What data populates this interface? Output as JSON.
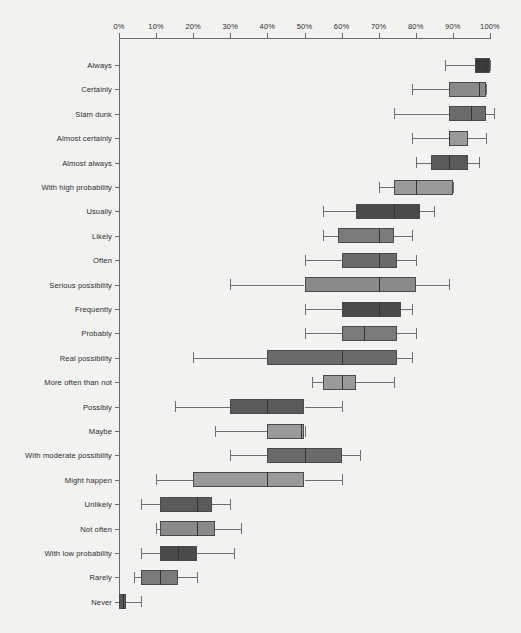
{
  "chart_data": {
    "type": "box",
    "title": "",
    "xlabel": "",
    "ylabel": "",
    "xlim": [
      0,
      100
    ],
    "grid": false,
    "legend": null,
    "x_tick_labels": [
      "0%",
      "10%",
      "20%",
      "30%",
      "40%",
      "50%",
      "60%",
      "70%",
      "80%",
      "90%",
      "100%"
    ],
    "x_tick_values": [
      0,
      10,
      20,
      30,
      40,
      50,
      60,
      70,
      80,
      90,
      100
    ],
    "categories": [
      "Always",
      "Certainly",
      "Slam dunk",
      "Almost certainly",
      "Almost always",
      "With high probability",
      "Usually",
      "Likely",
      "Often",
      "Serious possibility",
      "Frequently",
      "Probably",
      "Real possibility",
      "More often than not",
      "Possibly",
      "Maybe",
      "With moderate possibility",
      "Might happen",
      "Unlikely",
      "Not often",
      "With low probability",
      "Rarely",
      "Never"
    ],
    "boxes": [
      {
        "label": "Always",
        "whisker_low": 88,
        "q1": 96,
        "median": 99,
        "q3": 100,
        "whisker_high": 100,
        "fill": "#3a3a3a"
      },
      {
        "label": "Certainly",
        "whisker_low": 79,
        "q1": 89,
        "median": 97,
        "q3": 99,
        "whisker_high": 99,
        "fill": "#8a8a8a"
      },
      {
        "label": "Slam dunk",
        "whisker_low": 74,
        "q1": 89,
        "median": 95,
        "q3": 99,
        "whisker_high": 101,
        "fill": "#6b6b6b"
      },
      {
        "label": "Almost certainly",
        "whisker_low": 79,
        "q1": 89,
        "median": 89,
        "q3": 94,
        "whisker_high": 99,
        "fill": "#9a9a9a"
      },
      {
        "label": "Almost always",
        "whisker_low": 80,
        "q1": 84,
        "median": 89,
        "q3": 94,
        "whisker_high": 97,
        "fill": "#5a5a5a"
      },
      {
        "label": "With high probability",
        "whisker_low": 70,
        "q1": 74,
        "median": 80,
        "q3": 90,
        "whisker_high": 90,
        "fill": "#9a9a9a"
      },
      {
        "label": "Usually",
        "whisker_low": 55,
        "q1": 64,
        "median": 74,
        "q3": 81,
        "whisker_high": 85,
        "fill": "#4a4a4a"
      },
      {
        "label": "Likely",
        "whisker_low": 55,
        "q1": 59,
        "median": 70,
        "q3": 74,
        "whisker_high": 79,
        "fill": "#7a7a7a"
      },
      {
        "label": "Often",
        "whisker_low": 50,
        "q1": 60,
        "median": 70,
        "q3": 75,
        "whisker_high": 80,
        "fill": "#6a6a6a"
      },
      {
        "label": "Serious possibility",
        "whisker_low": 30,
        "q1": 50,
        "median": 70,
        "q3": 80,
        "whisker_high": 89,
        "fill": "#8a8a8a"
      },
      {
        "label": "Frequently",
        "whisker_low": 50,
        "q1": 60,
        "median": 70,
        "q3": 76,
        "whisker_high": 79,
        "fill": "#4a4a4a"
      },
      {
        "label": "Probably",
        "whisker_low": 50,
        "q1": 60,
        "median": 66,
        "q3": 75,
        "whisker_high": 80,
        "fill": "#7a7a7a"
      },
      {
        "label": "Real possibility",
        "whisker_low": 20,
        "q1": 40,
        "median": 60,
        "q3": 75,
        "whisker_high": 79,
        "fill": "#6a6a6a"
      },
      {
        "label": "More often than not",
        "whisker_low": 52,
        "q1": 55,
        "median": 60,
        "q3": 64,
        "whisker_high": 74,
        "fill": "#9a9a9a"
      },
      {
        "label": "Possibly",
        "whisker_low": 15,
        "q1": 30,
        "median": 40,
        "q3": 50,
        "whisker_high": 60,
        "fill": "#5a5a5a"
      },
      {
        "label": "Maybe",
        "whisker_low": 26,
        "q1": 40,
        "median": 49,
        "q3": 50,
        "whisker_high": 50,
        "fill": "#9a9a9a"
      },
      {
        "label": "With moderate possibility",
        "whisker_low": 30,
        "q1": 40,
        "median": 50,
        "q3": 60,
        "whisker_high": 65,
        "fill": "#6a6a6a"
      },
      {
        "label": "Might happen",
        "whisker_low": 10,
        "q1": 20,
        "median": 40,
        "q3": 50,
        "whisker_high": 60,
        "fill": "#9a9a9a"
      },
      {
        "label": "Unlikely",
        "whisker_low": 6,
        "q1": 11,
        "median": 21,
        "q3": 25,
        "whisker_high": 30,
        "fill": "#5a5a5a"
      },
      {
        "label": "Not often",
        "whisker_low": 10,
        "q1": 11,
        "median": 21,
        "q3": 26,
        "whisker_high": 33,
        "fill": "#8a8a8a"
      },
      {
        "label": "With low probability",
        "whisker_low": 6,
        "q1": 11,
        "median": 16,
        "q3": 21,
        "whisker_high": 31,
        "fill": "#4a4a4a"
      },
      {
        "label": "Rarely",
        "whisker_low": 4,
        "q1": 6,
        "median": 11,
        "q3": 16,
        "whisker_high": 21,
        "fill": "#7a7a7a"
      },
      {
        "label": "Never",
        "whisker_low": 0,
        "q1": 0,
        "median": 1,
        "q3": 2,
        "whisker_high": 6,
        "fill": "#5a5a5a"
      }
    ]
  },
  "style": {
    "background": "#f2f2f0",
    "axis_color": "#6b6b6b",
    "text_color": "#2e2e2e"
  }
}
